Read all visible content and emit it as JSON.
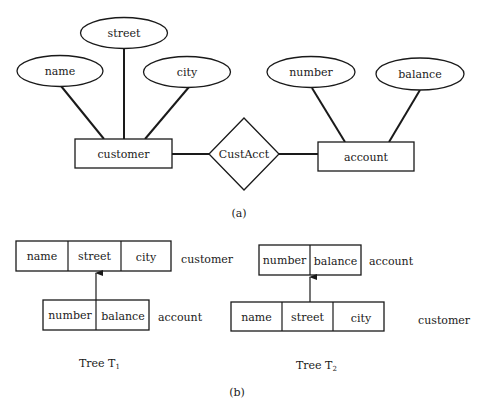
{
  "part_a": {
    "caption": "(a)",
    "entities": [
      {
        "id": "customer",
        "label": "customer"
      },
      {
        "id": "account",
        "label": "account"
      }
    ],
    "relationship": {
      "label": "CustAcct"
    },
    "attributes": [
      {
        "label": "name",
        "entity": "customer"
      },
      {
        "label": "street",
        "entity": "customer"
      },
      {
        "label": "city",
        "entity": "customer"
      },
      {
        "label": "number",
        "entity": "account"
      },
      {
        "label": "balance",
        "entity": "account"
      }
    ]
  },
  "part_b": {
    "caption": "(b)",
    "trees": [
      {
        "caption_prefix": "Tree T",
        "caption_sub": "1",
        "parent": {
          "label": "customer",
          "fields": [
            "name",
            "street",
            "city"
          ]
        },
        "child": {
          "label": "account",
          "fields": [
            "number",
            "balance"
          ]
        }
      },
      {
        "caption_prefix": "Tree T",
        "caption_sub": "2",
        "parent": {
          "label": "account",
          "fields": [
            "number",
            "balance"
          ]
        },
        "child": {
          "label": "customer",
          "fields": [
            "name",
            "street",
            "city"
          ]
        }
      }
    ]
  },
  "colors": {
    "ink": "#1a1a1a",
    "background": "#ffffff"
  }
}
